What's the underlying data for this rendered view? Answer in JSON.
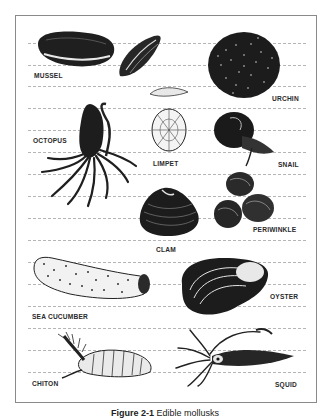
{
  "figure": {
    "caption_number": "Figure 2-1",
    "caption_text": "Edible mollusks"
  },
  "labels": {
    "mussel": "MUSSEL",
    "urchin": "URCHIN",
    "octopus": "OCTOPUS",
    "limpet": "LIMPET",
    "snail": "SNAIL",
    "periwinkle": "PERIWINKLE",
    "clam": "CLAM",
    "oyster": "OYSTER",
    "sea_cucumber": "SEA CUCUMBER",
    "chiton": "CHITON",
    "squid": "SQUID"
  },
  "colors": {
    "ink": "#1a1a1a",
    "frame": "#8a8a8a",
    "rule": "#b5b5b5"
  }
}
